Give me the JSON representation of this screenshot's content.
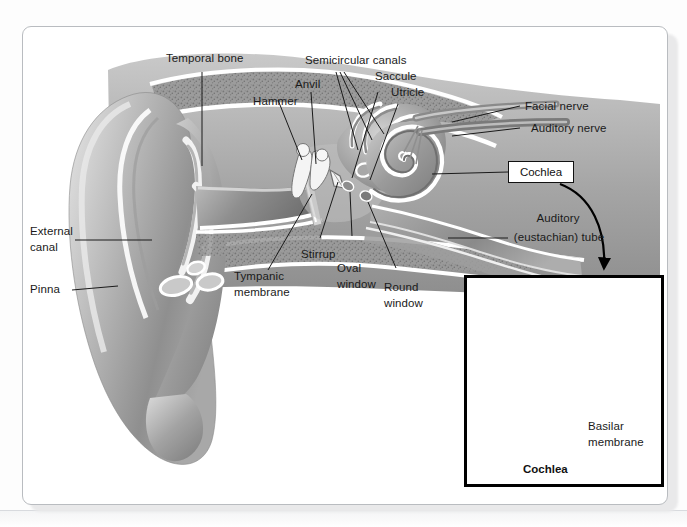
{
  "figure": {
    "type": "anatomical-cross-section-diagram"
  },
  "labels": {
    "temporal_bone": "Temporal bone",
    "hammer": "Hammer",
    "anvil": "Anvil",
    "semicircular_canals": "Semicircular canals",
    "saccule": "Saccule",
    "utricle": "Utricle",
    "facial_nerve": "Facial nerve",
    "auditory_nerve": "Auditory nerve",
    "cochlea_box": "Cochlea",
    "auditory_tube_line1": "Auditory",
    "auditory_tube_line2": "(eustachian) tube",
    "external_canal_line1": "External",
    "external_canal_line2": "canal",
    "pinna": "Pinna",
    "tympanic_membrane_line1": "Tympanic",
    "tympanic_membrane_line2": "membrane",
    "stirrup": "Stirrup",
    "oval_window_line1": "Oval",
    "oval_window_line2": "window",
    "round_window_line1": "Round",
    "round_window_line2": "window"
  },
  "inset": {
    "caption": "Cochlea",
    "basilar_line1": "Basilar",
    "basilar_line2": "membrane"
  },
  "colors": {
    "frame_border": "#b9bcc0",
    "ink": "#1a1a1a",
    "box_border": "#111111",
    "inset_border": "#000000",
    "tissue_mid": "#9a9a9a",
    "tissue_dark": "#6e6e6e",
    "tissue_light": "#cfcfcf",
    "cartilage_highlight": "#ffffff",
    "bone_speckle": "#8b8b8b",
    "page_background": "#ffffff"
  }
}
